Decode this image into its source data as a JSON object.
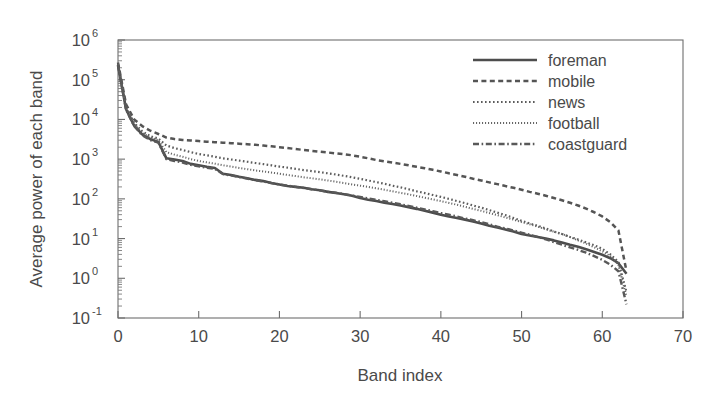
{
  "chart_data": {
    "type": "line",
    "title": "",
    "xlabel": "Band index",
    "ylabel": "Average power of each band",
    "xlim": [
      0,
      70
    ],
    "ylim": [
      0.1,
      1000000
    ],
    "yscale": "log",
    "grid": false,
    "legend_position": "top-right",
    "xticks": [
      0,
      10,
      20,
      30,
      40,
      50,
      60,
      70
    ],
    "xtick_labels": [
      "0",
      "10",
      "20",
      "30",
      "40",
      "50",
      "60",
      "70"
    ],
    "yticks": [
      0.1,
      1,
      10,
      100,
      1000,
      10000,
      100000,
      1000000
    ],
    "ytick_labels": [
      "10-1",
      "100",
      "101",
      "102",
      "103",
      "104",
      "105",
      "106"
    ],
    "ytick_mantissa": "10",
    "ytick_exponents": [
      "-1",
      "0",
      "1",
      "2",
      "3",
      "4",
      "5",
      "6"
    ],
    "x": [
      0,
      1,
      2,
      3,
      4,
      5,
      6,
      7,
      8,
      9,
      10,
      11,
      12,
      13,
      14,
      15,
      16,
      17,
      18,
      19,
      20,
      21,
      22,
      23,
      24,
      25,
      26,
      27,
      28,
      29,
      30,
      31,
      32,
      33,
      34,
      35,
      36,
      37,
      38,
      39,
      40,
      41,
      42,
      43,
      44,
      45,
      46,
      47,
      48,
      49,
      50,
      51,
      52,
      53,
      54,
      55,
      56,
      57,
      58,
      59,
      60,
      61,
      62,
      63
    ],
    "series": [
      {
        "name": "foreman",
        "style": "solid",
        "color": "#4d4d4d",
        "values": [
          230000,
          18000,
          7000,
          4200,
          3200,
          2700,
          1050,
          980,
          900,
          760,
          700,
          640,
          600,
          430,
          400,
          360,
          330,
          300,
          280,
          250,
          230,
          210,
          200,
          190,
          175,
          165,
          150,
          140,
          130,
          120,
          105,
          95,
          88,
          80,
          74,
          68,
          62,
          56,
          50,
          45,
          40,
          36,
          33,
          30,
          27,
          24,
          21,
          19,
          17,
          15,
          13,
          12,
          11,
          10,
          9,
          8,
          7,
          6.2,
          5.4,
          4.6,
          3.9,
          3.2,
          2.4,
          1.3
        ]
      },
      {
        "name": "mobile",
        "style": "dashed",
        "color": "#555555",
        "values": [
          270000,
          24000,
          10000,
          6800,
          5200,
          4300,
          3500,
          3200,
          3050,
          2950,
          2850,
          2750,
          2680,
          2600,
          2520,
          2450,
          2380,
          2300,
          2200,
          2100,
          2000,
          1900,
          1800,
          1700,
          1620,
          1540,
          1470,
          1400,
          1330,
          1250,
          1150,
          1050,
          950,
          880,
          820,
          760,
          700,
          640,
          590,
          540,
          490,
          440,
          400,
          360,
          320,
          290,
          260,
          235,
          210,
          190,
          170,
          150,
          135,
          120,
          105,
          92,
          80,
          68,
          57,
          46,
          36,
          26,
          16,
          1.5
        ]
      },
      {
        "name": "news",
        "style": "dotted",
        "color": "#5c5c5c",
        "values": [
          250000,
          20000,
          8200,
          5000,
          3800,
          3300,
          2200,
          1900,
          1700,
          1500,
          1350,
          1250,
          1150,
          1050,
          980,
          920,
          860,
          800,
          750,
          700,
          650,
          610,
          570,
          530,
          500,
          470,
          440,
          410,
          380,
          350,
          320,
          290,
          265,
          240,
          215,
          195,
          175,
          155,
          140,
          125,
          112,
          100,
          88,
          78,
          68,
          60,
          52,
          45,
          39,
          33,
          28,
          24,
          21,
          18,
          15,
          13,
          11,
          9.5,
          8,
          6.8,
          5.5,
          4,
          2.6,
          0.45
        ]
      },
      {
        "name": "football",
        "style": "dotted-fine",
        "color": "#666666",
        "values": [
          240000,
          19000,
          7600,
          4600,
          3500,
          3000,
          1500,
          1300,
          1150,
          1000,
          900,
          830,
          770,
          700,
          650,
          600,
          560,
          520,
          490,
          460,
          430,
          400,
          375,
          350,
          330,
          310,
          290,
          270,
          250,
          230,
          215,
          200,
          185,
          170,
          155,
          142,
          130,
          118,
          107,
          97,
          88,
          79,
          71,
          63,
          56,
          50,
          44,
          39,
          34,
          30,
          26,
          23,
          20,
          17,
          15,
          13,
          11,
          9,
          7.5,
          6,
          4.8,
          3.6,
          2.2,
          0.35
        ]
      },
      {
        "name": "coastguard",
        "style": "dashdot",
        "color": "#595959",
        "values": [
          235000,
          17500,
          6800,
          4000,
          3000,
          2600,
          1000,
          900,
          820,
          720,
          660,
          610,
          570,
          420,
          390,
          355,
          325,
          295,
          275,
          250,
          230,
          215,
          200,
          188,
          175,
          163,
          152,
          142,
          132,
          122,
          112,
          103,
          95,
          87,
          80,
          73,
          66,
          60,
          54,
          49,
          44,
          40,
          36,
          32,
          29,
          26,
          23,
          20,
          18,
          16,
          14,
          12.5,
          11,
          9.5,
          8.2,
          7,
          6,
          5.2,
          4.4,
          3.6,
          2.9,
          2.2,
          1.5,
          0.22
        ]
      }
    ]
  },
  "legend": {
    "entries": [
      {
        "label": "foreman"
      },
      {
        "label": "mobile"
      },
      {
        "label": "news"
      },
      {
        "label": "football"
      },
      {
        "label": "coastguard"
      }
    ]
  }
}
